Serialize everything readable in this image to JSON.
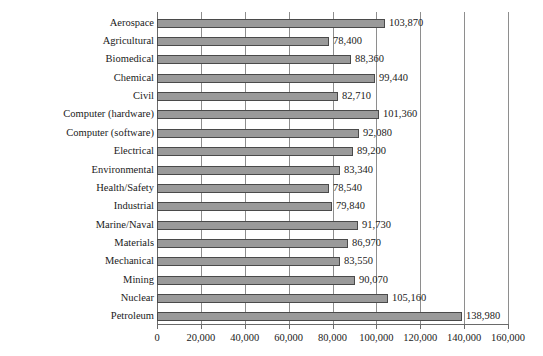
{
  "chart_data": {
    "type": "bar",
    "orientation": "horizontal",
    "title": "",
    "xlabel": "",
    "ylabel": "",
    "xlim": [
      0,
      160000
    ],
    "xticks": [
      0,
      20000,
      40000,
      60000,
      80000,
      100000,
      120000,
      140000,
      160000
    ],
    "xtick_labels": [
      "0",
      "20,000",
      "40,000",
      "60,000",
      "80,000",
      "100,000",
      "120,000",
      "140,000",
      "160,000"
    ],
    "grid": true,
    "grid_axis": "x",
    "legend": null,
    "bar_color": "#9a9a9a",
    "bar_edge_color": "#4a4a4a",
    "categories": [
      "Aerospace",
      "Agricultural",
      "Biomedical",
      "Chemical",
      "Civil",
      "Computer (hardware)",
      "Computer (software)",
      "Electrical",
      "Environmental",
      "Health/Safety",
      "Industrial",
      "Marine/Naval",
      "Materials",
      "Mechanical",
      "Mining",
      "Nuclear",
      "Petroleum"
    ],
    "values": [
      103870,
      78400,
      88360,
      99440,
      82710,
      101360,
      92080,
      89200,
      83340,
      78540,
      79840,
      91730,
      86970,
      83550,
      90070,
      105160,
      138980
    ],
    "value_labels": [
      "103,870",
      "78,400",
      "88,360",
      "99,440",
      "82,710",
      "101,360",
      "92,080",
      "89,200",
      "83,340",
      "78,540",
      "79,840",
      "91,730",
      "86,970",
      "83,550",
      "90,070",
      "105,160",
      "138,980"
    ]
  },
  "caption": {
    "text": ""
  }
}
